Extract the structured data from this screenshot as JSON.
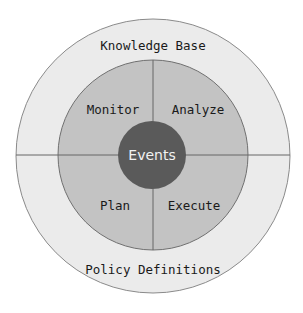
{
  "diagram": {
    "outer_ring": {
      "top_label": "Knowledge Base",
      "bottom_label": "Policy Definitions",
      "fill": "#ebebeb",
      "stroke": "#8a8a8a"
    },
    "middle_ring": {
      "quadrants": {
        "top_left": "Monitor",
        "top_right": "Analyze",
        "bottom_left": "Plan",
        "bottom_right": "Execute"
      },
      "fill": "#c3c3c3",
      "stroke": "#707070"
    },
    "center": {
      "label": "Events",
      "fill": "#5a5a5a"
    },
    "divider_color": "#666666"
  }
}
